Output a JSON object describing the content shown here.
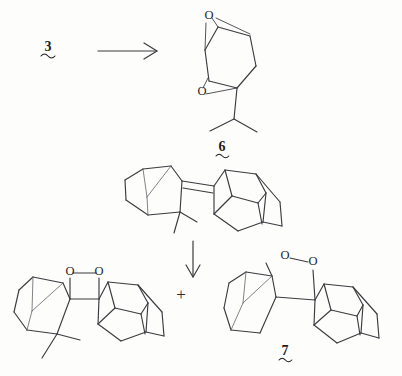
{
  "figure": {
    "kind": "chemical-reaction-scheme",
    "background_color": "#fdfdfc",
    "bond_color": "#3b3b40",
    "label_color": "#1d1d20"
  },
  "labels": {
    "starting_material": "3",
    "epoxide_product": "6",
    "hydroperoxide_product": "7",
    "plus": "+",
    "oxygen": "O"
  },
  "reaction_top": {
    "reactant_label": "3",
    "arrow": "right-arrow",
    "product_label": "6",
    "product_name": "diepoxide-isopropyl-cyclohexane",
    "oxygen_atoms": [
      "O",
      "O"
    ]
  },
  "reaction_bottom": {
    "reactant_name": "bicyclic-alkene-adamantylidene",
    "arrow": "down-arrow",
    "products": [
      {
        "label": "",
        "name": "spiro-dioxetane",
        "oxygen_atoms": [
          "O",
          "O"
        ]
      },
      {
        "label": "7",
        "name": "allylic-hydroperoxide",
        "oxygen_atoms": [
          "O",
          "O"
        ]
      }
    ],
    "separator": "+"
  },
  "atoms": {
    "epoxide_top_o": "O",
    "epoxide_bottom_o": "O",
    "dioxetane_o1": "O",
    "dioxetane_o2": "O",
    "peroxide_o1": "O",
    "peroxide_o2": "O"
  }
}
